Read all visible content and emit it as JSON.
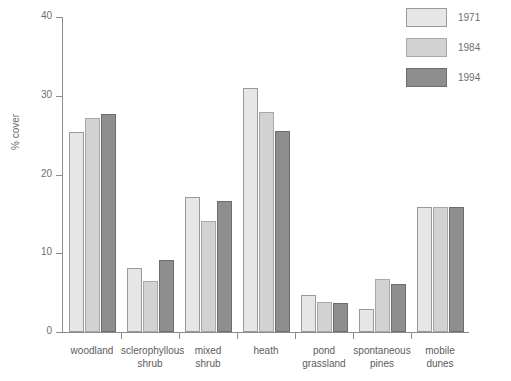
{
  "chart_data": {
    "type": "bar",
    "title": "",
    "xlabel": "",
    "ylabel": "% cover",
    "ylim": [
      0,
      40
    ],
    "yticks": [
      0,
      10,
      20,
      30,
      40
    ],
    "ytick_labels": [
      "0",
      "10",
      "20",
      "30",
      "40"
    ],
    "grid": false,
    "legend_position": "top-right",
    "categories": [
      "woodland",
      "sclerophyllous\nshrub",
      "mixed\nshrub",
      "heath",
      "pond\ngrassland",
      "spontaneous\npines",
      "mobile\ndunes"
    ],
    "series": [
      {
        "name": "1971",
        "color": "#e6e6e6",
        "values": [
          25.4,
          8.1,
          17.1,
          31.0,
          4.7,
          2.9,
          15.9
        ]
      },
      {
        "name": "1984",
        "color": "#d2d2d2",
        "values": [
          27.2,
          6.5,
          14.1,
          28.0,
          3.8,
          6.7,
          15.9
        ]
      },
      {
        "name": "1994",
        "color": "#8e8e8e",
        "values": [
          27.7,
          9.2,
          16.7,
          25.5,
          3.7,
          6.1,
          15.9
        ]
      }
    ]
  },
  "legend": {
    "items": [
      {
        "label": "1971"
      },
      {
        "label": "1984"
      },
      {
        "label": "1994"
      }
    ]
  },
  "caption": {
    "clipped_top_text": ""
  }
}
